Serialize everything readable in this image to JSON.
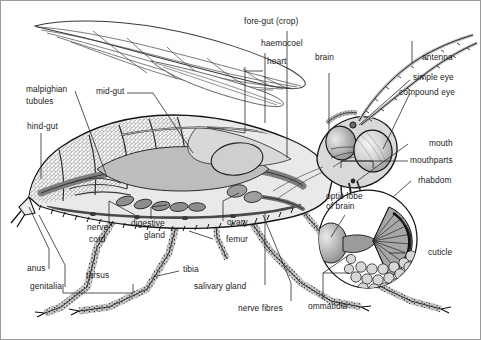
{
  "figure": {
    "style": "black-and-white engraved scientific illustration with leader-line callouts",
    "background_color": "#ffffff",
    "border_color": "#9a9a9a",
    "text_color": "#1b1b1b",
    "inset": {
      "name": "compound-eye-detail",
      "shape": "circle",
      "description": "magnified cutaway of compound eye showing radiating ommatidia and hexagonal cuticle facets"
    }
  },
  "labels": {
    "fore_gut": "fore-gut (crop)",
    "haemocoel": "haemocoel",
    "heart": "heart",
    "brain": "brain",
    "antenna": "antenna",
    "simple_eye": "simple eye",
    "compound_eye": "compound eye",
    "mouth": "mouth",
    "mouthparts": "mouthparts",
    "rhabdom": "rhabdom",
    "cuticle": "cuticle",
    "ommatidia": "ommatidia",
    "nerve_fibres": "nerve fibres",
    "optic_lobe_line1": "optic lobe",
    "optic_lobe_line2": "of brain",
    "salivary_gland": "salivary gland",
    "femur": "femur",
    "ovary": "ovary",
    "tibia": "tibia",
    "tarsus": "tarsus",
    "genitalia": "genitalia",
    "anus": "anus",
    "nerve_cord_line1": "nerve",
    "nerve_cord_line2": "cord",
    "digestive_gland_line1": "digestive",
    "digestive_gland_line2": "gland",
    "hind_gut": "hind-gut",
    "malpighian_line1": "malpighian",
    "malpighian_line2": "tubules",
    "mid_gut": "mid-gut"
  }
}
